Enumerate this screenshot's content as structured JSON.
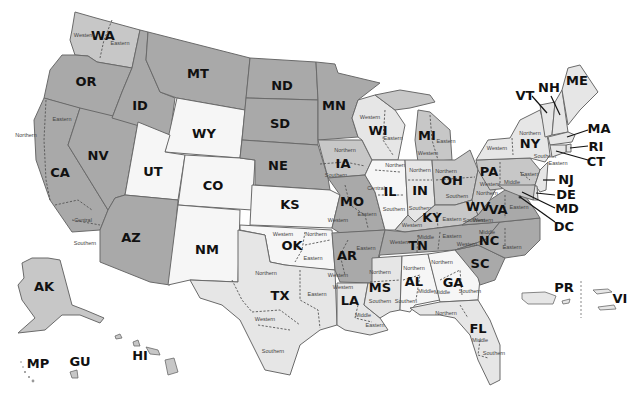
{
  "map": {
    "title": "U.S. Federal Judicial Districts",
    "legend_shades": {
      "dark": "#a9a9a9",
      "mid": "#c7c7c7",
      "light": "#e6e6e6",
      "white": "#f6f6f6"
    },
    "states": {
      "WA": {
        "label": "WA",
        "districts": [
          "Western",
          "Eastern"
        ]
      },
      "OR": {
        "label": "OR"
      },
      "CA": {
        "label": "CA",
        "districts": [
          "Northern",
          "Eastern",
          "Central",
          "Southern"
        ]
      },
      "NV": {
        "label": "NV"
      },
      "ID": {
        "label": "ID"
      },
      "MT": {
        "label": "MT"
      },
      "WY": {
        "label": "WY"
      },
      "UT": {
        "label": "UT"
      },
      "CO": {
        "label": "CO"
      },
      "AZ": {
        "label": "AZ"
      },
      "NM": {
        "label": "NM"
      },
      "ND": {
        "label": "ND"
      },
      "SD": {
        "label": "SD"
      },
      "NE": {
        "label": "NE"
      },
      "KS": {
        "label": "KS"
      },
      "OK": {
        "label": "OK",
        "districts": [
          "Western",
          "Northern",
          "Eastern"
        ]
      },
      "TX": {
        "label": "TX",
        "districts": [
          "Northern",
          "Eastern",
          "Western",
          "Southern"
        ]
      },
      "MN": {
        "label": "MN"
      },
      "IA": {
        "label": "IA",
        "districts": [
          "Northern",
          "Southern"
        ]
      },
      "MO": {
        "label": "MO",
        "districts": [
          "Western",
          "Eastern"
        ]
      },
      "AR": {
        "label": "AR",
        "districts": [
          "Eastern",
          "Western"
        ]
      },
      "LA": {
        "label": "LA",
        "districts": [
          "Western",
          "Middle",
          "Eastern"
        ]
      },
      "WI": {
        "label": "WI",
        "districts": [
          "Western",
          "Eastern"
        ]
      },
      "IL": {
        "label": "IL",
        "districts": [
          "Northern",
          "Central",
          "Southern"
        ]
      },
      "MI": {
        "label": "MI",
        "districts": [
          "Eastern",
          "Western"
        ]
      },
      "IN": {
        "label": "IN",
        "districts": [
          "Northern",
          "Southern"
        ]
      },
      "OH": {
        "label": "OH",
        "districts": [
          "Northern",
          "Southern"
        ]
      },
      "KY": {
        "label": "KY",
        "districts": [
          "Western",
          "Eastern"
        ]
      },
      "TN": {
        "label": "TN",
        "districts": [
          "Western",
          "Middle",
          "Eastern"
        ]
      },
      "MS": {
        "label": "MS",
        "districts": [
          "Northern",
          "Southern"
        ]
      },
      "AL": {
        "label": "AL",
        "districts": [
          "Northern",
          "Middle",
          "Southern"
        ]
      },
      "GA": {
        "label": "GA",
        "districts": [
          "Northern",
          "Middle",
          "Southern"
        ]
      },
      "FL": {
        "label": "FL",
        "districts": [
          "Northern",
          "Middle",
          "Southern"
        ]
      },
      "SC": {
        "label": "SC"
      },
      "NC": {
        "label": "NC",
        "districts": [
          "Western",
          "Middle",
          "Eastern"
        ]
      },
      "VA": {
        "label": "VA",
        "districts": [
          "Western",
          "Eastern"
        ]
      },
      "WV": {
        "label": "WV",
        "districts": [
          "Northern",
          "Southern"
        ]
      },
      "PA": {
        "label": "PA",
        "districts": [
          "Western",
          "Middle",
          "Eastern"
        ]
      },
      "NY": {
        "label": "NY",
        "districts": [
          "Northern",
          "Western",
          "Southern",
          "Eastern"
        ]
      },
      "VT": {
        "label": "VT"
      },
      "NH": {
        "label": "NH"
      },
      "ME": {
        "label": "ME"
      },
      "MA": {
        "label": "MA"
      },
      "RI": {
        "label": "RI"
      },
      "CT": {
        "label": "CT"
      },
      "NJ": {
        "label": "NJ"
      },
      "DE": {
        "label": "DE"
      },
      "MD": {
        "label": "MD"
      },
      "DC": {
        "label": "DC"
      },
      "AK": {
        "label": "AK"
      },
      "HI": {
        "label": "HI"
      },
      "GU": {
        "label": "GU"
      },
      "MP": {
        "label": "MP"
      },
      "PR": {
        "label": "PR"
      },
      "VI": {
        "label": "VI"
      }
    }
  }
}
